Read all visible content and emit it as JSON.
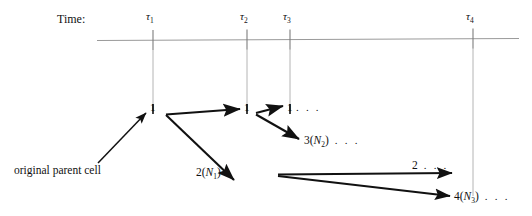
{
  "figure": {
    "title_label": "Time:",
    "background": "#ffffff",
    "ink_color": "#111111",
    "guide_color": "#9a9a9a",
    "width": 532,
    "height": 216
  },
  "timeline": {
    "axis_label": "Time:",
    "ticks": [
      {
        "name": "tau-1",
        "symbol": "τ",
        "subscript": "1",
        "x": 153
      },
      {
        "name": "tau-2",
        "symbol": "τ",
        "subscript": "2",
        "x": 247
      },
      {
        "name": "tau-3",
        "symbol": "τ",
        "subscript": "3",
        "x": 290
      },
      {
        "name": "tau-4",
        "symbol": "τ",
        "subscript": "4",
        "x": 473
      }
    ]
  },
  "nodes": [
    {
      "name": "node-generation-1",
      "label": "1",
      "x": 153,
      "y": 110
    },
    {
      "name": "node-generation-2",
      "label": "1",
      "x": 247,
      "y": 110
    },
    {
      "name": "node-generation-3",
      "label": "1",
      "x": 290,
      "y": 110
    }
  ],
  "labels": {
    "node_1": "1",
    "node_2": "1",
    "node_3": "1",
    "dots_after_node3": ". . .",
    "branch_3n2": "3(N₂) . . .",
    "branch_3n2_num": "3(",
    "branch_3n2_var": "N",
    "branch_3n2_sub": "2",
    "branch_3n2_close": ")",
    "branch_3n2_dots": ". . .",
    "branch_2n1_num": "2(",
    "branch_2n1_var": "N",
    "branch_2n1_sub": "1",
    "branch_2n1_close": ")",
    "branch_2_dots_num": "2",
    "branch_2_dots": ". . .",
    "branch_4n3_num": "4(",
    "branch_4n3_var": "N",
    "branch_4n3_sub": "3",
    "branch_4n3_close": ")",
    "branch_4n3_dots": ". . .",
    "original_parent_cell": "original parent cell"
  },
  "arrows": [
    {
      "name": "arrow-parent-to-node1",
      "from": [
        98,
        163
      ],
      "to": [
        147,
        112
      ]
    },
    {
      "name": "arrow-node1-to-node2",
      "from": [
        163,
        113
      ],
      "to": [
        241,
        108
      ]
    },
    {
      "name": "arrow-node1-to-2n1",
      "from": [
        163,
        114
      ],
      "to": [
        235,
        180
      ]
    },
    {
      "name": "arrow-node2-to-node3",
      "from": [
        256,
        112
      ],
      "to": [
        284,
        105
      ]
    },
    {
      "name": "arrow-node2-to-3n2",
      "from": [
        256,
        114
      ],
      "to": [
        300,
        139
      ]
    },
    {
      "name": "arrow-fork-to-2dots",
      "from": [
        278,
        175
      ],
      "to": [
        455,
        173
      ]
    },
    {
      "name": "arrow-fork-to-4n3",
      "from": [
        278,
        176
      ],
      "to": [
        452,
        196
      ]
    }
  ]
}
